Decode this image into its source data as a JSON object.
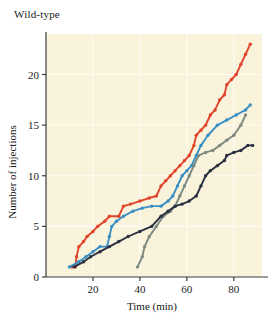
{
  "chart_data": {
    "type": "line",
    "title": "Wild-type",
    "xlabel": "Time (min)",
    "ylabel": "Number of injections",
    "xlim": [
      0,
      92
    ],
    "ylim": [
      0,
      24
    ],
    "xticks": [
      20,
      40,
      60,
      80
    ],
    "yticks": [
      0,
      5,
      10,
      15,
      20
    ],
    "grid": true,
    "legend": "none",
    "plot_background": "#faf3dc",
    "series": [
      {
        "name": "red-trace",
        "color": "#e0452b",
        "marker": "circle",
        "points": [
          [
            11,
            1
          ],
          [
            12.5,
            1
          ],
          [
            13,
            2
          ],
          [
            14,
            3
          ],
          [
            16,
            3.5
          ],
          [
            17.5,
            4
          ],
          [
            20,
            4.5
          ],
          [
            22,
            5
          ],
          [
            25,
            5.5
          ],
          [
            27,
            6
          ],
          [
            31,
            6
          ],
          [
            33,
            7
          ],
          [
            36,
            7.2
          ],
          [
            40,
            7.5
          ],
          [
            44,
            7.8
          ],
          [
            47,
            8
          ],
          [
            49,
            9
          ],
          [
            51,
            9.5
          ],
          [
            53,
            10
          ],
          [
            55,
            10.5
          ],
          [
            57,
            11
          ],
          [
            59,
            11.5
          ],
          [
            61,
            12
          ],
          [
            63,
            13
          ],
          [
            64,
            14
          ],
          [
            66,
            14.5
          ],
          [
            68,
            15
          ],
          [
            70,
            16
          ],
          [
            72,
            16.5
          ],
          [
            74,
            17.5
          ],
          [
            76,
            18
          ],
          [
            77,
            19
          ],
          [
            79,
            19.5
          ],
          [
            81,
            20
          ],
          [
            83,
            21
          ],
          [
            85,
            22
          ],
          [
            87,
            23
          ]
        ]
      },
      {
        "name": "blue-trace",
        "color": "#3a8fc4",
        "marker": "circle",
        "points": [
          [
            10,
            1
          ],
          [
            14,
            1.5
          ],
          [
            17,
            2
          ],
          [
            20,
            2.5
          ],
          [
            23,
            3
          ],
          [
            26,
            3
          ],
          [
            27,
            4
          ],
          [
            28,
            5
          ],
          [
            30,
            5.5
          ],
          [
            33,
            6
          ],
          [
            37,
            6.5
          ],
          [
            41,
            6.8
          ],
          [
            45,
            7
          ],
          [
            49,
            7
          ],
          [
            52,
            7.5
          ],
          [
            54,
            8
          ],
          [
            56,
            9
          ],
          [
            58,
            10
          ],
          [
            60,
            10.5
          ],
          [
            62,
            11
          ],
          [
            64,
            12
          ],
          [
            66,
            13
          ],
          [
            69,
            14
          ],
          [
            73,
            15
          ],
          [
            77,
            15.5
          ],
          [
            81,
            16
          ],
          [
            85,
            16.5
          ],
          [
            87,
            17
          ]
        ]
      },
      {
        "name": "gray-green-trace",
        "color": "#7d8a80",
        "marker": "circle",
        "points": [
          [
            39,
            1
          ],
          [
            41,
            2
          ],
          [
            42,
            3
          ],
          [
            44,
            4
          ],
          [
            47,
            5
          ],
          [
            50,
            6
          ],
          [
            53,
            6.5
          ],
          [
            55,
            7
          ],
          [
            57,
            8
          ],
          [
            59,
            9
          ],
          [
            61,
            10
          ],
          [
            63,
            11
          ],
          [
            65,
            12
          ],
          [
            68,
            12.3
          ],
          [
            71,
            12.5
          ],
          [
            74,
            13
          ],
          [
            77,
            13.5
          ],
          [
            80,
            14
          ],
          [
            83,
            15
          ],
          [
            85,
            16
          ]
        ]
      },
      {
        "name": "dark-navy-trace",
        "color": "#2b3040",
        "marker": "circle",
        "points": [
          [
            12,
            1
          ],
          [
            16,
            1.5
          ],
          [
            19,
            2
          ],
          [
            23,
            2.5
          ],
          [
            27,
            3
          ],
          [
            31,
            3.5
          ],
          [
            35,
            4
          ],
          [
            40,
            4.5
          ],
          [
            45,
            5
          ],
          [
            49,
            6
          ],
          [
            52,
            6.5
          ],
          [
            55,
            7
          ],
          [
            58,
            7.2
          ],
          [
            61,
            7.5
          ],
          [
            64,
            8
          ],
          [
            66,
            9
          ],
          [
            68,
            10
          ],
          [
            70,
            10.5
          ],
          [
            73,
            11
          ],
          [
            76,
            11.5
          ],
          [
            77,
            12
          ],
          [
            80,
            12.3
          ],
          [
            83,
            12.5
          ],
          [
            86,
            13
          ],
          [
            88,
            13
          ]
        ]
      }
    ]
  }
}
